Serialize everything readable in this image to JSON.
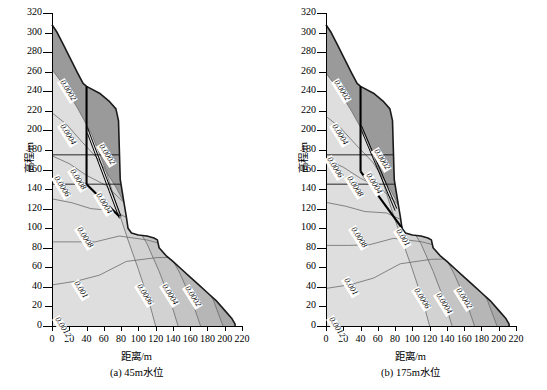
{
  "figure": {
    "axis_title_x": "距离/m",
    "axis_title_y": "高程/m"
  },
  "panels": [
    {
      "id": "a",
      "caption": "(a) 45m水位",
      "water_level": "45m"
    },
    {
      "id": "b",
      "caption": "(b) 175m水位",
      "water_level": "175m"
    }
  ],
  "chart_data": {
    "type": "line",
    "subtype": "filled-contour",
    "title": "",
    "xlabel": "距离/m",
    "ylabel": "高程/m",
    "xlim": [
      0,
      220
    ],
    "ylim": [
      0,
      320
    ],
    "xticks": [
      0,
      20,
      40,
      60,
      80,
      100,
      120,
      140,
      160,
      180,
      200,
      220
    ],
    "yticks": [
      0,
      20,
      40,
      60,
      80,
      100,
      120,
      140,
      160,
      180,
      200,
      220,
      240,
      260,
      280,
      300,
      320
    ],
    "grid": false,
    "legend": "none",
    "contour_levels": [
      0.0002,
      0.0004,
      0.0006,
      0.0008,
      0.001,
      0.0012
    ],
    "panels": [
      {
        "name": "(a) 45m水位",
        "contour_labels": [
          {
            "value": "0.0002",
            "x": 10,
            "y": 250
          },
          {
            "value": "0.0004",
            "x": 10,
            "y": 205
          },
          {
            "value": "0.0002",
            "x": 55,
            "y": 185
          },
          {
            "value": "0.0006",
            "x": 3,
            "y": 152
          },
          {
            "value": "0.0008",
            "x": 22,
            "y": 160
          },
          {
            "value": "0.0004",
            "x": 52,
            "y": 135
          },
          {
            "value": "0.0008",
            "x": 30,
            "y": 100
          },
          {
            "value": "0.001",
            "x": 27,
            "y": 45
          },
          {
            "value": "0.0012",
            "x": 5,
            "y": 8
          },
          {
            "value": "0.0006",
            "x": 100,
            "y": 42
          },
          {
            "value": "0.0004",
            "x": 128,
            "y": 42
          },
          {
            "value": "0.0002",
            "x": 155,
            "y": 40
          }
        ],
        "surface_profile": [
          [
            0,
            308
          ],
          [
            6,
            300
          ],
          [
            13,
            288
          ],
          [
            22,
            272
          ],
          [
            30,
            258
          ],
          [
            36,
            248
          ],
          [
            40,
            245
          ],
          [
            55,
            238
          ],
          [
            66,
            230
          ],
          [
            74,
            222
          ],
          [
            77,
            210
          ],
          [
            78,
            180
          ],
          [
            79,
            150
          ],
          [
            83,
            128
          ],
          [
            86,
            112
          ],
          [
            88,
            100
          ],
          [
            92,
            95
          ],
          [
            100,
            93
          ],
          [
            110,
            92
          ],
          [
            118,
            90
          ],
          [
            122,
            88
          ],
          [
            124,
            80
          ],
          [
            132,
            72
          ],
          [
            140,
            66
          ],
          [
            150,
            58
          ],
          [
            160,
            50
          ],
          [
            170,
            42
          ],
          [
            180,
            34
          ],
          [
            190,
            26
          ],
          [
            200,
            16
          ],
          [
            208,
            8
          ],
          [
            212,
            2
          ],
          [
            212,
            0
          ]
        ],
        "slip_surface": [
          [
            40,
            245
          ],
          [
            40,
            145
          ],
          [
            78,
            112
          ]
        ],
        "bench_lines": [
          175,
          145
        ]
      },
      {
        "name": "(b) 175m水位",
        "contour_labels": [
          {
            "value": "0.0002",
            "x": 10,
            "y": 250
          },
          {
            "value": "0.0004",
            "x": 8,
            "y": 205
          },
          {
            "value": "0.0006",
            "x": 2,
            "y": 172
          },
          {
            "value": "0.0002",
            "x": 57,
            "y": 180
          },
          {
            "value": "0.0008",
            "x": 25,
            "y": 152
          },
          {
            "value": "0.0004",
            "x": 48,
            "y": 155
          },
          {
            "value": "0.0008",
            "x": 30,
            "y": 100
          },
          {
            "value": "0.001",
            "x": 82,
            "y": 98
          },
          {
            "value": "0.001",
            "x": 22,
            "y": 48
          },
          {
            "value": "0.0012",
            "x": 5,
            "y": 8
          },
          {
            "value": "0.0006",
            "x": 103,
            "y": 38
          },
          {
            "value": "0.0004",
            "x": 128,
            "y": 33
          },
          {
            "value": "0.0002",
            "x": 152,
            "y": 38
          }
        ],
        "surface_profile": [
          [
            0,
            308
          ],
          [
            6,
            300
          ],
          [
            13,
            288
          ],
          [
            22,
            272
          ],
          [
            30,
            258
          ],
          [
            36,
            248
          ],
          [
            40,
            245
          ],
          [
            55,
            238
          ],
          [
            66,
            230
          ],
          [
            74,
            222
          ],
          [
            77,
            210
          ],
          [
            78,
            180
          ],
          [
            79,
            150
          ],
          [
            83,
            128
          ],
          [
            86,
            112
          ],
          [
            88,
            100
          ],
          [
            92,
            95
          ],
          [
            100,
            93
          ],
          [
            110,
            92
          ],
          [
            118,
            90
          ],
          [
            122,
            88
          ],
          [
            124,
            80
          ],
          [
            132,
            72
          ],
          [
            140,
            66
          ],
          [
            150,
            58
          ],
          [
            160,
            50
          ],
          [
            170,
            42
          ],
          [
            180,
            34
          ],
          [
            190,
            26
          ],
          [
            200,
            16
          ],
          [
            208,
            8
          ],
          [
            212,
            2
          ],
          [
            212,
            0
          ]
        ],
        "slip_surface": [
          [
            40,
            245
          ],
          [
            40,
            158
          ],
          [
            88,
            100
          ]
        ],
        "bench_lines": [
          175,
          145
        ]
      }
    ]
  },
  "colors": {
    "band_darkest": "#9a9a9a",
    "band_dark": "#a8a8a8",
    "band_mid": "#b6b6b6",
    "band_light": "#c4c4c4",
    "band_lighter": "#d2d2d2",
    "band_lightest": "#dedede",
    "outline": "#1a1a1a",
    "contour_line": "#6b6b6b",
    "background": "#ffffff"
  }
}
